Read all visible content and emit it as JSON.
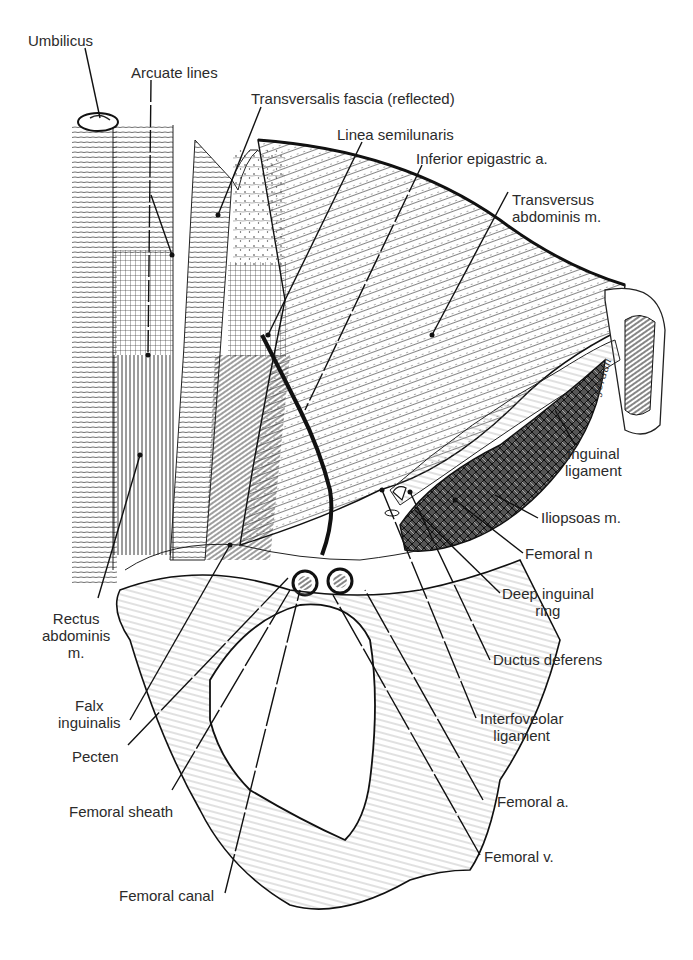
{
  "figure": {
    "kind": "anatomical illustration",
    "artist_signature": "Jordan",
    "labels": [
      {
        "id": "umbilicus",
        "text": "Umbilicus"
      },
      {
        "id": "arcuate-lines",
        "text": "Arcuate lines"
      },
      {
        "id": "transversalis-fascia",
        "text": "Transversalis fascia (reflected)"
      },
      {
        "id": "linea-semilunaris",
        "text": "Linea semilunaris"
      },
      {
        "id": "inferior-epigastric",
        "text": "Inferior epigastric a."
      },
      {
        "id": "transversus-abdominis",
        "text": "Transversus\nabdominis m."
      },
      {
        "id": "inguinal-ligament",
        "text": "Inguinal\nligament"
      },
      {
        "id": "iliopsoas",
        "text": "Iliopsoas m."
      },
      {
        "id": "femoral-n",
        "text": "Femoral n"
      },
      {
        "id": "deep-inguinal-ring",
        "text": "Deep inguinal\nring"
      },
      {
        "id": "ductus-deferens",
        "text": "Ductus deferens"
      },
      {
        "id": "interfoveolar-ligament",
        "text": "Interfoveolar\nligament"
      },
      {
        "id": "femoral-a",
        "text": "Femoral a."
      },
      {
        "id": "femoral-v",
        "text": "Femoral v."
      },
      {
        "id": "rectus-abdominis",
        "text": "Rectus\nabdominis\nm."
      },
      {
        "id": "falx-inguinalis",
        "text": "Falx\ninguinalis"
      },
      {
        "id": "pecten",
        "text": "Pecten"
      },
      {
        "id": "femoral-sheath",
        "text": "Femoral sheath"
      },
      {
        "id": "femoral-canal",
        "text": "Femoral canal"
      }
    ]
  }
}
